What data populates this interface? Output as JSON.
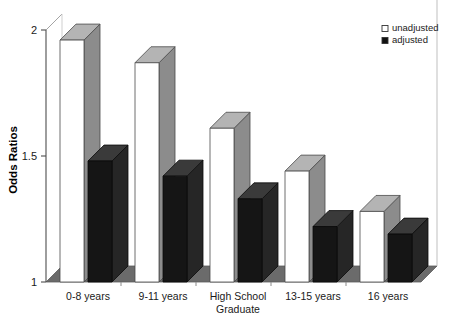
{
  "chart_data": {
    "type": "bar",
    "title": "",
    "subtitle": "",
    "xlabel": "",
    "ylabel": "Odds Ratios",
    "ylim": [
      1,
      2
    ],
    "yticks": [
      1,
      1.5,
      2
    ],
    "ytick_labels": [
      "1",
      "1.5",
      "2"
    ],
    "grid": false,
    "legend_position": "top-right",
    "style": "3d-bar",
    "categories": [
      "0-8 years",
      "9-11 years",
      "High School Graduate",
      "13-15 years",
      "16 years"
    ],
    "category_lines": [
      [
        "0-8 years"
      ],
      [
        "9-11 years"
      ],
      [
        "High School",
        "Graduate"
      ],
      [
        "13-15 years"
      ],
      [
        "16 years"
      ]
    ],
    "series": [
      {
        "name": "unadjusted",
        "color": "#ffffff",
        "values": [
          1.96,
          1.87,
          1.61,
          1.44,
          1.28
        ]
      },
      {
        "name": "adjusted",
        "color": "#151515",
        "values": [
          1.48,
          1.42,
          1.33,
          1.22,
          1.19
        ]
      }
    ]
  },
  "legend": {
    "items": [
      {
        "label": "unadjusted",
        "swatch": "open-square"
      },
      {
        "label": "adjusted",
        "swatch": "filled-square"
      }
    ]
  },
  "axes": {
    "y_title": "Odds Ratios",
    "y_tick_0": "2",
    "y_tick_1": "1.5",
    "y_tick_2": "1"
  },
  "colors": {
    "floor": "#6b6b6b",
    "floor_edge": "#5a5a5a",
    "bar_white_face": "#ffffff",
    "bar_white_top": "#b4b4b4",
    "bar_white_side": "#8c8c8c",
    "bar_black_face": "#151515",
    "bar_black_top": "#3a3a3a",
    "bar_black_side": "#262626",
    "axis": "#4d4d4d",
    "text": "#1a1a1a"
  }
}
